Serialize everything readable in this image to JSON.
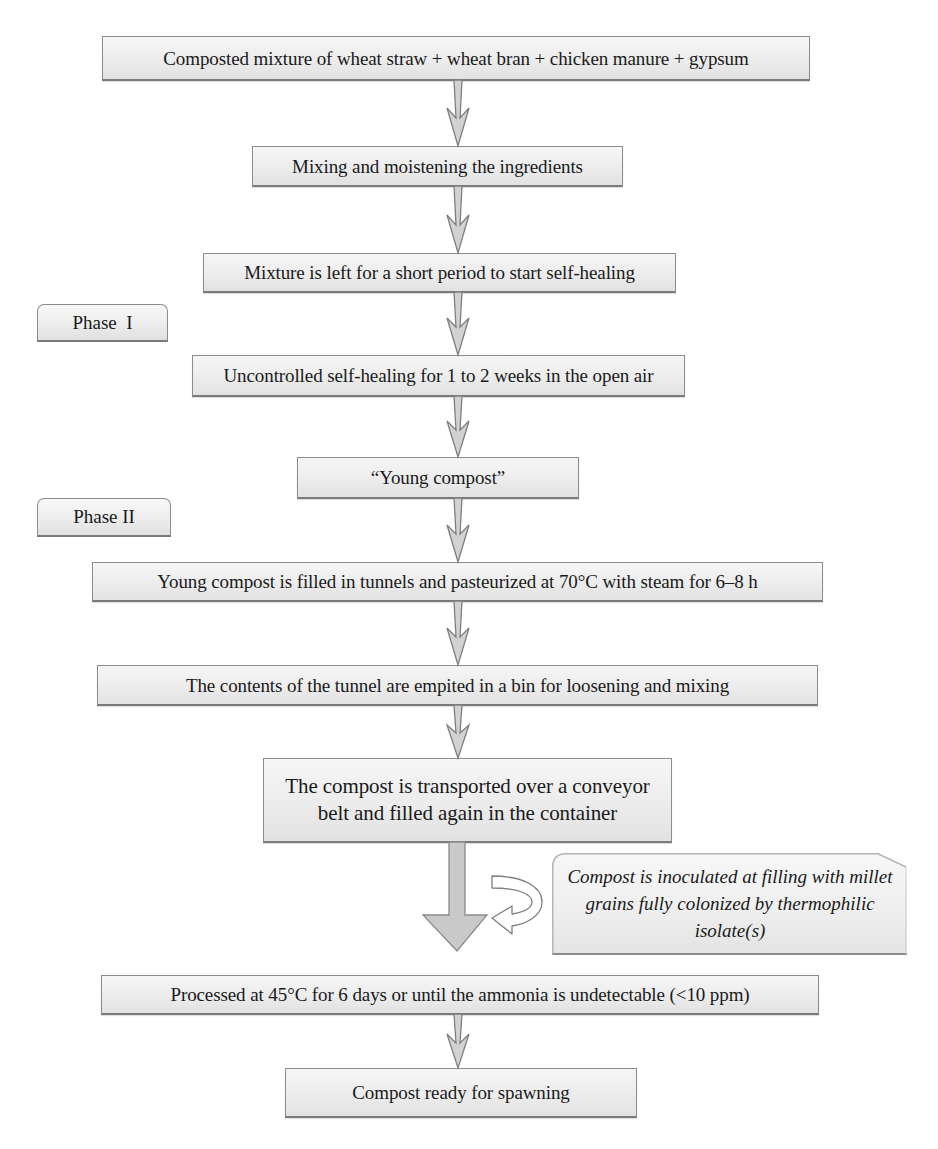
{
  "diagram": {
    "steps": [
      {
        "id": "step-1",
        "label": "Composted mixture of wheat straw + wheat bran + chicken manure + gypsum"
      },
      {
        "id": "step-2",
        "label": "Mixing and moistening the ingredients"
      },
      {
        "id": "step-3",
        "label": "Mixture is left for a short period to start self-healing"
      },
      {
        "id": "step-4",
        "label": "Uncontrolled self-healing for 1 to 2 weeks in the open air"
      },
      {
        "id": "step-5",
        "label": "“Young compost”"
      },
      {
        "id": "step-6",
        "label": "Young compost is filled in tunnels and pasteurized at 70°C with steam for 6–8 h"
      },
      {
        "id": "step-7",
        "label": "The contents of the tunnel are empited in a bin for loosening and mixing"
      },
      {
        "id": "step-8",
        "label": "The compost is transported over a conveyor belt and filled again in the container"
      },
      {
        "id": "step-9",
        "label": "Processed at 45°C for 6 days or until the ammonia is undetectable (<10 ppm)"
      },
      {
        "id": "step-10",
        "label": "Compost ready for spawning"
      }
    ],
    "phases": [
      {
        "label": "Phase  I"
      },
      {
        "label": "Phase II"
      }
    ],
    "callout": {
      "label": "Compost is inoculated at filling with millet grains fully colonized by thermophilic isolate(s)"
    },
    "colors": {
      "box_fill": "#ececec",
      "box_border": "#8c8c8c",
      "arrow_fill": "#c8c8c8",
      "arrow_stroke": "#7f7f7f",
      "text": "#1a1a1a"
    }
  }
}
